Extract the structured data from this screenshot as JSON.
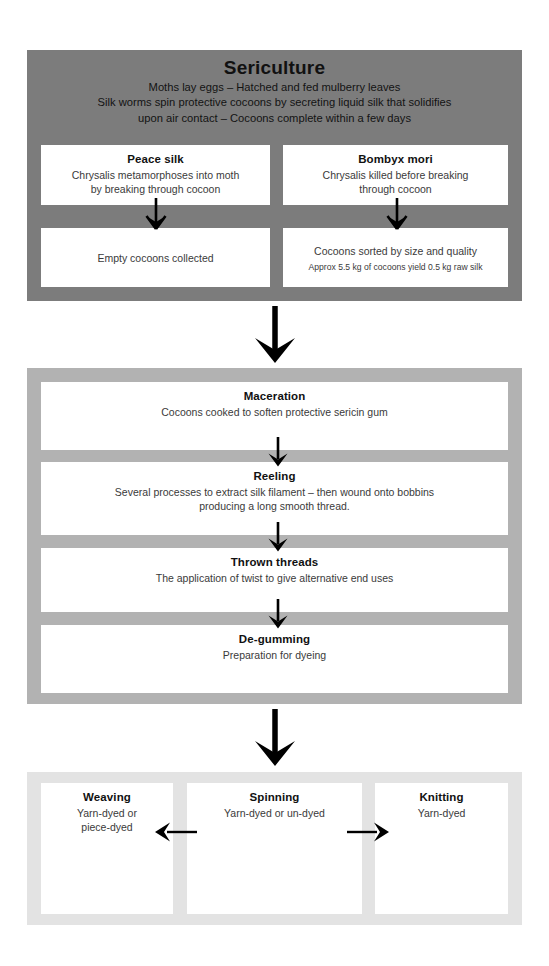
{
  "diagram": {
    "colors": {
      "section1_bg": "#7c7c7c",
      "section2_bg": "#b2b2b2",
      "section3_bg": "#e3e3e3",
      "card_bg": "#ffffff",
      "text": "#111111",
      "arrow": "#000000"
    }
  },
  "section1": {
    "name": "Sericulture",
    "header": {
      "title": "Sericulture",
      "subtitle": "Moths lay eggs – Hatched and fed mulberry leaves\nSilk worms spin protective cocoons by secreting liquid silk that solidifies\nupon air contact – Cocoons complete within a few days"
    },
    "cards": [
      {
        "title": "Peace silk",
        "body": "Chrysalis metamorphoses into moth\nby breaking through cocoon"
      },
      {
        "title": "Bombyx mori",
        "body": "Chrysalis killed before breaking\nthrough cocoon"
      },
      {
        "title": "",
        "body": "Empty cocoons collected"
      },
      {
        "title": "",
        "body": "Cocoons sorted by size and quality",
        "sub": "Approx 5.5 kg of cocoons yield 0.5 kg raw silk"
      }
    ],
    "arrows": [
      {
        "name": "peace-silk-down-arrow",
        "direction": "down"
      },
      {
        "name": "bombyx-mori-down-arrow",
        "direction": "down"
      }
    ]
  },
  "section2": {
    "name": "Processing",
    "cards": [
      {
        "title": "Maceration",
        "body": "Cocoons cooked to soften protective sericin gum"
      },
      {
        "title": "Reeling",
        "body": "Several processes to extract silk filament – then wound onto bobbins\nproducing a long smooth thread."
      },
      {
        "title": "Thrown threads",
        "body": "The application of twist to give alternative end uses"
      },
      {
        "title": "De-gumming",
        "body": "Preparation for dyeing"
      }
    ],
    "arrows": [
      {
        "name": "maceration-to-reeling-arrow",
        "direction": "down"
      },
      {
        "name": "reeling-to-thrown-threads-arrow",
        "direction": "down"
      },
      {
        "name": "thrown-threads-to-degumming-arrow",
        "direction": "down"
      }
    ]
  },
  "section3": {
    "name": "Fabric construction",
    "cards": [
      {
        "title": "Weaving",
        "body": "Yarn-dyed or\npiece-dyed"
      },
      {
        "title": "Spinning",
        "body": "Yarn-dyed or un-dyed"
      },
      {
        "title": "Knitting",
        "body": "Yarn-dyed"
      }
    ],
    "arrows": [
      {
        "name": "spinning-to-weaving-arrow",
        "direction": "left"
      },
      {
        "name": "spinning-to-knitting-arrow",
        "direction": "right"
      }
    ]
  },
  "connectors": [
    {
      "name": "sericulture-to-processing-arrow",
      "direction": "down"
    },
    {
      "name": "processing-to-fabric-arrow",
      "direction": "down"
    }
  ]
}
